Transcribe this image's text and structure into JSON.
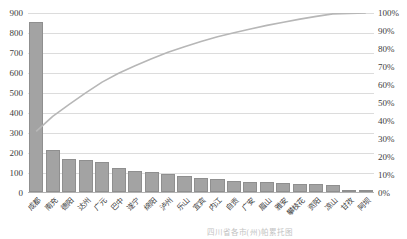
{
  "figure": {
    "caption": "四川省各市(州)帕累托图"
  },
  "chart_data": {
    "type": "bar",
    "subtype": "pareto",
    "title": "",
    "xlabel": "",
    "ylabel_left": "",
    "ylabel_right": "",
    "legend_position": "none",
    "grid": true,
    "categories": [
      "成都",
      "南充",
      "德阳",
      "达州",
      "广元",
      "巴中",
      "遂宁",
      "绵阳",
      "泸州",
      "乐山",
      "宜宾",
      "内江",
      "自贡",
      "广安",
      "眉山",
      "雅安",
      "攀枝花",
      "资阳",
      "凉山",
      "甘孜",
      "阿坝"
    ],
    "series": [
      {
        "name": "数量",
        "type": "bar",
        "color": "#a3a3a3",
        "values": [
          850,
          210,
          165,
          158,
          150,
          120,
          105,
          98,
          88,
          78,
          70,
          66,
          56,
          52,
          50,
          44,
          42,
          38,
          34,
          8,
          5
        ]
      },
      {
        "name": "累计百分比",
        "type": "line",
        "color": "#b7b7b7",
        "values": [
          34.2,
          42.6,
          49.3,
          55.6,
          61.6,
          66.5,
          70.7,
          74.6,
          78.2,
          81.3,
          84.1,
          86.8,
          89.0,
          91.1,
          93.1,
          94.9,
          96.6,
          98.1,
          99.5,
          99.8,
          100.0
        ]
      }
    ],
    "left_axis": {
      "min": 0,
      "max": 900,
      "step": 100,
      "ticks": [
        "900",
        "800",
        "700",
        "600",
        "500",
        "400",
        "300",
        "200",
        "100",
        "0"
      ]
    },
    "right_axis": {
      "min": 0,
      "max": 100,
      "step": 10,
      "ticks": [
        "100%",
        "90%",
        "80%",
        "70%",
        "60%",
        "50%",
        "40%",
        "30%",
        "20%",
        "10%",
        "0%"
      ]
    }
  },
  "colors": {
    "bar": "#a3a3a3",
    "bar_border": "#8f8f8f",
    "line": "#b7b7b7",
    "grid": "#dcdcdc",
    "axis_line": "#b3b3b3",
    "text": "#404040",
    "caption": "#c3c3c3"
  }
}
